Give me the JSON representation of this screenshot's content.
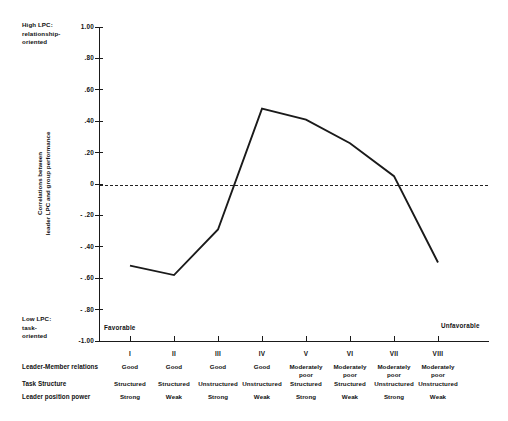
{
  "chart_data": {
    "type": "line",
    "title": "",
    "xlabel": "",
    "ylabel": "Correlations between leader LPC and group performance",
    "ylabel_lines": [
      "Correlations between",
      "leader LPC and group performance"
    ],
    "categories": [
      "I",
      "II",
      "III",
      "IV",
      "V",
      "VI",
      "VII",
      "VIII"
    ],
    "values": [
      -0.52,
      -0.58,
      -0.29,
      0.48,
      0.41,
      0.26,
      0.05,
      -0.5
    ],
    "ylim": [
      -1.0,
      1.0
    ],
    "ytick_labels": [
      "1.00",
      ".80",
      ".60",
      ".40",
      ".20",
      "0",
      "- .20",
      "- .40",
      "- .60",
      "- .80",
      "-1.00"
    ],
    "ytick_values": [
      1.0,
      0.8,
      0.6,
      0.4,
      0.2,
      0.0,
      -0.2,
      -0.4,
      -0.6,
      -0.8,
      -1.0
    ],
    "grid": false,
    "legend": "none",
    "reference_line": {
      "value": 0,
      "style": "dashed"
    },
    "annotations": {
      "top_left": "High LPC:\nrelationship-\noriented",
      "bottom_left": "Low LPC:\ntask-\noriented",
      "axis_left_end": "Favorable",
      "axis_right_end": "Unfavorable"
    }
  },
  "axis_notes": {
    "high_lpc": "High LPC:\nrelationship-\noriented",
    "low_lpc": "Low LPC:\ntask-\noriented",
    "favorable": "Favorable",
    "unfavorable": "Unfavorable"
  },
  "condition_table": {
    "row_labels": [
      "Leader-Member relations",
      "Task Structure",
      "Leader position power"
    ],
    "columns": [
      "I",
      "II",
      "III",
      "IV",
      "V",
      "VI",
      "VII",
      "VIII"
    ],
    "rows": [
      {
        "label": "Leader-Member relations",
        "cells": [
          "Good",
          "Good",
          "Good",
          "Good",
          "Moderately poor",
          "Moderately poor",
          "Moderately poor",
          "Moderately poor"
        ]
      },
      {
        "label": "Task Structure",
        "cells": [
          "Structured",
          "Structured",
          "Unstructured",
          "Unstructured",
          "Structured",
          "Structured",
          "Unstructured",
          "Unstructured"
        ]
      },
      {
        "label": "Leader position power",
        "cells": [
          "Strong",
          "Weak",
          "Strong",
          "Weak",
          "Strong",
          "Weak",
          "Strong",
          "Weak"
        ]
      }
    ]
  },
  "colors": {
    "series": "#1a1a1a",
    "axis": "#1a1a1a",
    "reference": "#222222",
    "background": "#ffffff"
  }
}
